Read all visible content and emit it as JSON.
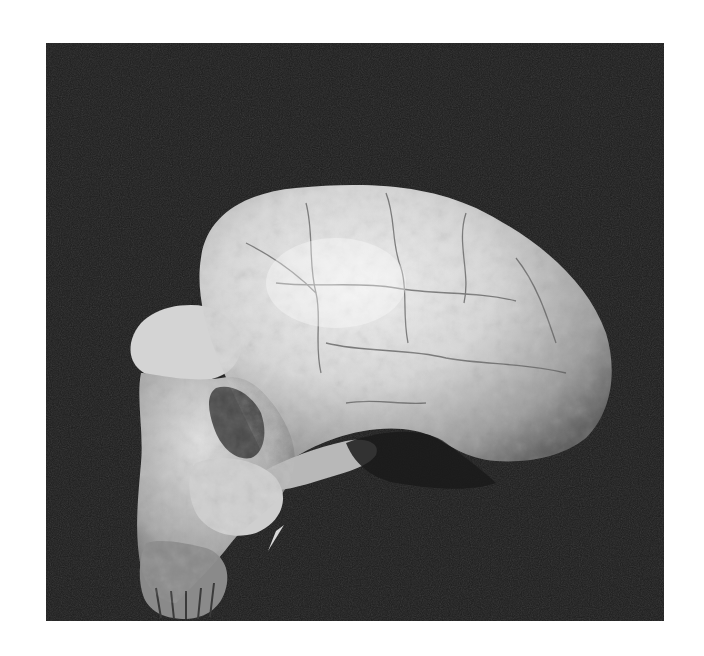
{
  "image": {
    "subject": "fossil hominin skull, lateral view",
    "background_color": "#1c1c1c",
    "border_color": "#ffffff",
    "bone_highlight_color": "#e6e6e6",
    "bone_mid_color": "#a8a8a8",
    "bone_shadow_color": "#4a4a4a"
  }
}
